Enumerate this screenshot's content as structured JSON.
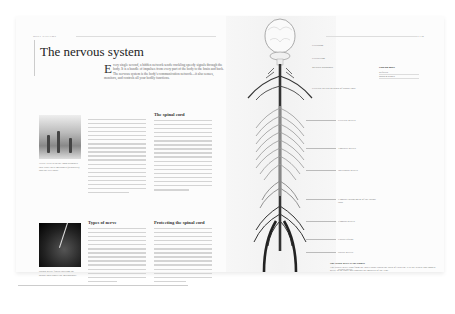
{
  "left_page": {
    "running_head": "BODY SYSTEMS",
    "title": "The nervous system",
    "intro": {
      "drop_cap": "E",
      "text": "very single second, a hidden network sends crackling speedy signals through the body. It is a bundle of impulses from every part of the body to the brain and back. The nervous system is the body's communication network—it also senses, monitors, and controls all your bodily functions."
    },
    "photos": [
      {
        "name": "nerve-cells-photo",
        "caption": "Nerve cells with the long branches that carry their messages (dendrites) and the cell body."
      },
      {
        "name": "spinal-nerve-photo",
        "caption": "Spinal nerve fibers entering the spinal cord under the microscope."
      }
    ],
    "columns": [
      {
        "heading": "",
        "lines": 20
      },
      {
        "heading": "The spinal cord",
        "lines": 20
      },
      {
        "heading": "Types of nerve",
        "lines": 18
      },
      {
        "heading": "Protecting the spinal cord",
        "lines": 17
      }
    ]
  },
  "right_page": {
    "running_head": "THE NERVOUS SYSTEM",
    "labels": [
      {
        "text": "Cerebrum",
        "top": 28
      },
      {
        "text": "Cerebellum",
        "top": 41
      },
      {
        "text": "Medulla oblongata",
        "top": 50
      },
      {
        "text": "Cervical plexus network of spinal cord",
        "top": 71
      },
      {
        "text": "Cervical nerves",
        "top": 103
      },
      {
        "text": "Thoracic nerves",
        "top": 131
      },
      {
        "text": "Intercostal nerves",
        "top": 153
      },
      {
        "text": "Lumbar enlargement of the spinal cord",
        "top": 182
      },
      {
        "text": "Lumbar nerves",
        "top": 204
      },
      {
        "text": "Cauda equina",
        "top": 222
      },
      {
        "text": "Sacral nerves",
        "top": 235
      },
      {
        "text": "Sciatic nerve",
        "top": 252
      }
    ],
    "fact_box": {
      "title": "Find out more",
      "rows": [
        "Reflexes",
        "Brain & senses"
      ]
    },
    "note": {
      "heading": "The sciatic nerve is the longest",
      "text": "The sciatic nerve runs from the lower spine down the back of each leg. It is the widest and longest nerve in the body and controls the muscles of the legs."
    }
  }
}
